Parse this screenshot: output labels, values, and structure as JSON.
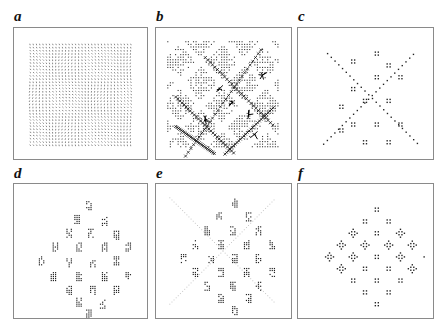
{
  "figure": {
    "panels": [
      {
        "id": "a",
        "label": "a",
        "description": "uniform dense field of short line segments",
        "x": 13,
        "y": 27,
        "w": 135,
        "h": 133,
        "label_x": 14,
        "label_y": 9,
        "pattern": "dense-grid"
      },
      {
        "id": "b",
        "label": "b",
        "description": "dense field with diagonal bands and crossing defect lines",
        "x": 155,
        "y": 27,
        "w": 137,
        "h": 133,
        "label_x": 156,
        "label_y": 9,
        "pattern": "banded"
      },
      {
        "id": "c",
        "label": "c",
        "description": "sparse point clusters with two diagonal chains",
        "x": 297,
        "y": 27,
        "w": 137,
        "h": 133,
        "label_x": 298,
        "label_y": 9,
        "pattern": "sparse-diagonals"
      },
      {
        "id": "d",
        "label": "d",
        "description": "diamond arrangement of irregular point clusters",
        "x": 13,
        "y": 183,
        "w": 135,
        "h": 136,
        "label_x": 14,
        "label_y": 166,
        "pattern": "irregular-diamond"
      },
      {
        "id": "e",
        "label": "e",
        "description": "diamond arrangement of clusters with faint diagonal background",
        "x": 155,
        "y": 183,
        "w": 137,
        "h": 136,
        "label_x": 156,
        "label_y": 166,
        "pattern": "faint-diamond"
      },
      {
        "id": "f",
        "label": "f",
        "description": "regular diamond lattice of four-point and cross-shaped clusters",
        "x": 297,
        "y": 183,
        "w": 137,
        "h": 136,
        "label_x": 298,
        "label_y": 166,
        "pattern": "regular-diamond"
      }
    ],
    "colors": {
      "ink": "#222222",
      "frame": "#8a8a8a",
      "faint": "#c8c8c8",
      "background": "#ffffff"
    }
  }
}
